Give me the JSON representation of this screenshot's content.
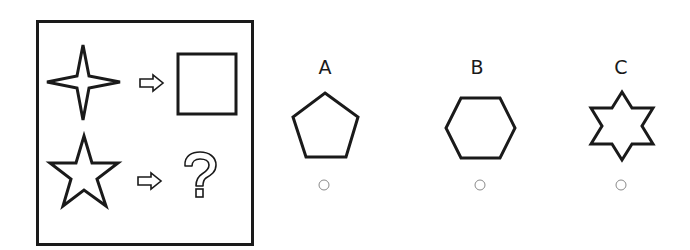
{
  "puzzle": {
    "question_panel": {
      "rows": [
        {
          "left_shape": "four-point-star",
          "arrow": "outline-right-arrow",
          "right_shape": "square"
        },
        {
          "left_shape": "five-point-star",
          "arrow": "outline-right-arrow",
          "right_shape": "question-mark"
        }
      ]
    },
    "options": [
      {
        "label": "A",
        "shape": "pentagon",
        "selected": false
      },
      {
        "label": "B",
        "shape": "hexagon",
        "selected": false
      },
      {
        "label": "C",
        "shape": "six-point-star",
        "selected": false
      }
    ],
    "colors": {
      "stroke": "#1a1a1a",
      "radio": "#8a8a8a",
      "background": "#ffffff"
    }
  }
}
